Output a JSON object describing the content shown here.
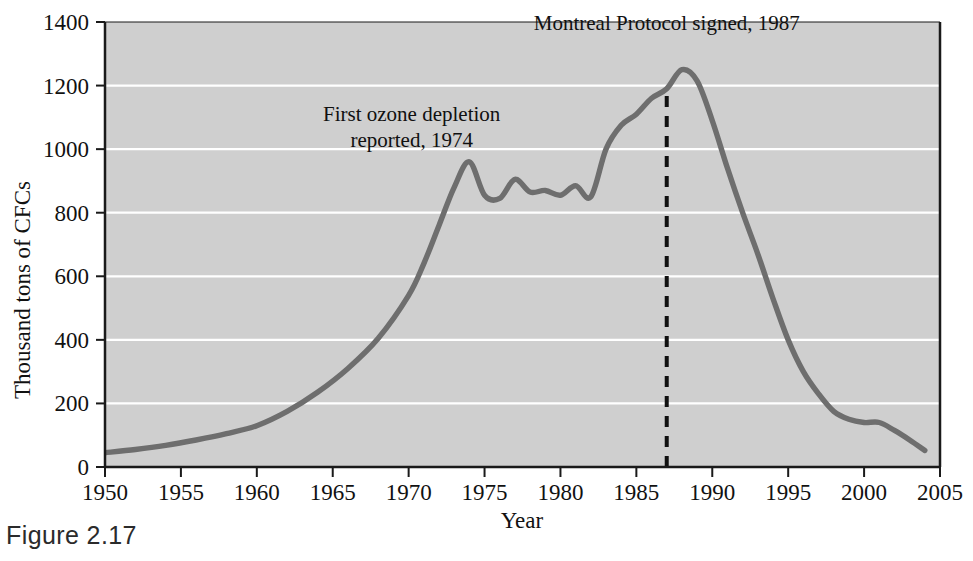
{
  "figure": {
    "caption": "Figure 2.17"
  },
  "chart_data": {
    "type": "line",
    "title": "",
    "xlabel": "Year",
    "ylabel": "Thousand tons of CFCs",
    "xlim": [
      1950,
      2005
    ],
    "ylim": [
      0,
      1400
    ],
    "grid": true,
    "legend": "none",
    "background_color": "#cfcfcf",
    "gridline_color": "#ffffff",
    "line_color": "#6e6e6e",
    "axis_color": "#1a1a1a",
    "xticks": [
      1950,
      1955,
      1960,
      1965,
      1970,
      1975,
      1980,
      1985,
      1990,
      1995,
      2000,
      2005
    ],
    "xtick_labels": [
      "1950",
      "1955",
      "1960",
      "1965",
      "1970",
      "1975",
      "1980",
      "1985",
      "1990",
      "1995",
      "2000",
      "2005"
    ],
    "yticks": [
      0,
      200,
      400,
      600,
      800,
      1000,
      1200,
      1400
    ],
    "ytick_labels": [
      "0",
      "200",
      "400",
      "600",
      "800",
      "1000",
      "1200",
      "1400"
    ],
    "series": [
      {
        "name": "CFC production",
        "x": [
          1950,
          1952,
          1954,
          1956,
          1958,
          1960,
          1962,
          1964,
          1966,
          1968,
          1970,
          1971,
          1972,
          1973,
          1974,
          1975,
          1976,
          1977,
          1978,
          1979,
          1980,
          1981,
          1982,
          1983,
          1984,
          1985,
          1986,
          1987,
          1988,
          1989,
          1990,
          1991,
          1992,
          1993,
          1994,
          1995,
          1996,
          1997,
          1998,
          1999,
          2000,
          2001,
          2002,
          2003,
          2004
        ],
        "values": [
          45,
          55,
          68,
          85,
          105,
          130,
          175,
          235,
          310,
          405,
          540,
          640,
          760,
          880,
          960,
          855,
          845,
          905,
          865,
          870,
          855,
          885,
          850,
          1000,
          1075,
          1110,
          1160,
          1190,
          1250,
          1215,
          1090,
          940,
          800,
          670,
          530,
          400,
          300,
          230,
          175,
          150,
          140,
          140,
          115,
          85,
          52
        ]
      }
    ],
    "annotations": [
      {
        "id": "first-ozone-depletion",
        "lines": [
          "First ozone depletion",
          "reported, 1974"
        ],
        "x": 1970.2,
        "y": 1090
      },
      {
        "id": "montreal-protocol",
        "lines": [
          "Montreal Protocol signed, 1987"
        ],
        "x": 1987.0,
        "y": 1375
      }
    ],
    "marker_lines": [
      {
        "id": "montreal-protocol-1987",
        "orientation": "vertical",
        "x": 1987,
        "style": "dashed",
        "y_from": 0,
        "y_to": 1175,
        "color": "#111111"
      }
    ]
  }
}
